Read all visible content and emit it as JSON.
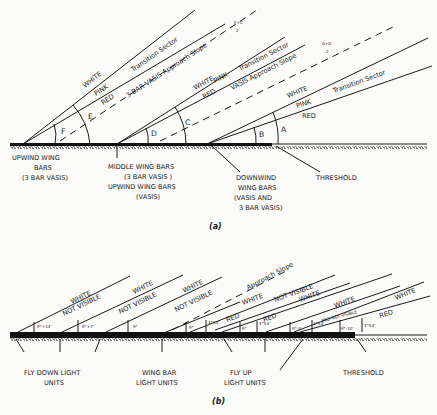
{
  "part_a": {
    "caption": "(a)",
    "sectors": {
      "upwind": {
        "white": "WHITE",
        "pink": "PINK",
        "red": "RED",
        "transition": "Transition Sector",
        "approach": "3-BAR VASIS Approach Slope",
        "formula_num": "F+C",
        "formula_den": "2"
      },
      "middle": {
        "white": "WHITE",
        "pink": "PINK",
        "red": "RED",
        "transition": "Transition Sector",
        "approach": "VASIS Approach Slope",
        "formula_num": "A+D",
        "formula_den": "2"
      },
      "downwind": {
        "white": "WHITE",
        "pink": "PINK",
        "red": "RED",
        "transition": "Transition Sector"
      }
    },
    "angles": [
      "F",
      "E",
      "D",
      "C",
      "B",
      "A"
    ],
    "labels": {
      "upwind_1": "UPWIND WING",
      "upwind_2": "BARS",
      "upwind_3": "(3 BAR VASIS)",
      "middle_1": "MIDDLE WING BARS",
      "middle_2": "(3 BAR VASIS )",
      "middle_3": "UPWIND WING BARS",
      "middle_4": "(VASIS)",
      "downwind_1": "DOWNWIND",
      "downwind_2": "WING BARS",
      "downwind_3": "(VASIS AND",
      "downwind_4": "3 BAR VASIS)",
      "threshold": "THRESHOLD"
    }
  },
  "part_b": {
    "caption": "(b)",
    "approach": "Approach Slope",
    "sector_labels": {
      "white": "WHITE",
      "not_visible": "NOT VISIBLE",
      "red": "RED",
      "red_not_visible": "RED NOT VISIBLE"
    },
    "angles": [
      "θ°+14'",
      "θ°+7'",
      "θ°",
      "θ°",
      "1°54'",
      "θ°",
      "1°54'",
      "θ°-5'",
      "1°54'",
      "θ°-10'",
      "1°54'"
    ],
    "labels": {
      "fly_down_1": "FLY DOWN LIGHT",
      "fly_down_2": "UNITS",
      "wing_bar_1": "WING BAR",
      "wing_bar_2": "LIGHT UNITS",
      "fly_up_1": "FLY UP",
      "fly_up_2": "LIGHT UNITS",
      "threshold": "THRESHOLD"
    }
  }
}
